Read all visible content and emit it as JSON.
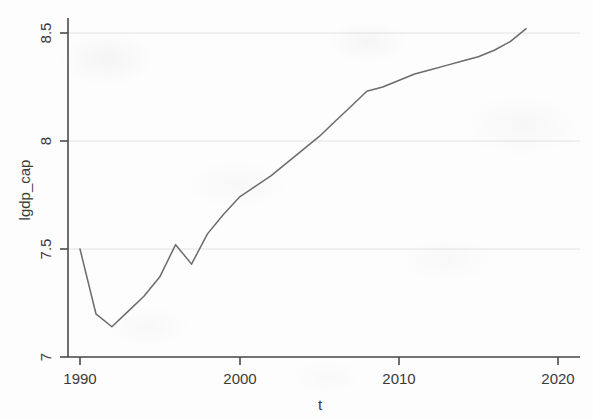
{
  "chart_data": {
    "type": "line",
    "title": "",
    "xlabel": "t",
    "ylabel": "lgdp_cap",
    "xlim": [
      1989.2,
      2020.5
    ],
    "ylim": [
      6.93,
      8.58
    ],
    "grid": true,
    "legend": "none",
    "xticks": [
      1990,
      2000,
      2010,
      2020
    ],
    "xtick_labels": [
      "1990",
      "2000",
      "2010",
      "2020"
    ],
    "yticks": [
      7,
      7.5,
      8,
      8.5
    ],
    "ytick_labels": [
      "7",
      "7.5",
      "8",
      "8.5"
    ],
    "series": [
      {
        "name": "lgdp_cap",
        "color": "#6b6b6b",
        "x": [
          1990,
          1991,
          1992,
          1993,
          1994,
          1995,
          1996,
          1997,
          1998,
          1999,
          2000,
          2001,
          2002,
          2003,
          2004,
          2005,
          2006,
          2007,
          2008,
          2009,
          2010,
          2011,
          2012,
          2013,
          2014,
          2015,
          2016,
          2017,
          2018
        ],
        "values": [
          7.5,
          7.2,
          7.14,
          7.21,
          7.28,
          7.37,
          7.52,
          7.43,
          7.57,
          7.66,
          7.74,
          7.79,
          7.84,
          7.9,
          7.96,
          8.02,
          8.09,
          8.16,
          8.23,
          8.25,
          8.28,
          8.31,
          8.33,
          8.35,
          8.37,
          8.39,
          8.42,
          8.46,
          8.52
        ]
      }
    ]
  },
  "axes": {
    "y_axis_title": "lgdp_cap",
    "x_axis_title": "t"
  },
  "tick_text": {
    "y": [
      "8.5",
      "8",
      "7.5",
      "7"
    ],
    "x": [
      "1990",
      "2000",
      "2010",
      "2020"
    ]
  }
}
